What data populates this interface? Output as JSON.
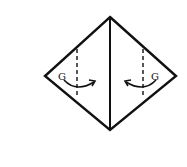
{
  "diagram": {
    "type": "origami-fold-step",
    "left_label": "G",
    "right_label": "G",
    "colors": {
      "line": "#111111",
      "background": "#ffffff"
    }
  }
}
